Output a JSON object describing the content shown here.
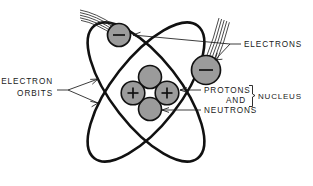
{
  "diagram": {
    "type": "bohr-atom-model",
    "background_color": "#ffffff",
    "line_color": "#111111",
    "particle_fill": "#9b9b9b",
    "text_color": "#1a1a1a"
  },
  "labels": {
    "electrons": "ELECTRONS",
    "electron_orbits_line1": "ELECTRON",
    "electron_orbits_line2": "ORBITS",
    "protons": "PROTONS",
    "and": "AND",
    "neutrons": "NEUTRONS",
    "nucleus": "NUCLEUS"
  },
  "particles": {
    "electron_charge_symbol": "minus",
    "proton_charge_symbol": "plus",
    "neutron_charge_symbol": "none",
    "electron_count": 2,
    "proton_count": 2,
    "neutron_count": 2,
    "orbit_count": 2
  }
}
